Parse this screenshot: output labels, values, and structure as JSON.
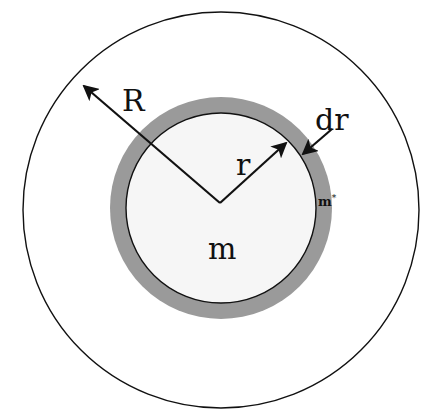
{
  "diagram": {
    "outer_circle": {
      "cx": 221,
      "cy": 210,
      "r": 198,
      "stroke": "#111111"
    },
    "shell_ring": {
      "cx": 221,
      "cy": 208,
      "r_outer": 111,
      "fill": "#9a9a9a"
    },
    "inner_sphere": {
      "cx": 221,
      "cy": 208,
      "r": 95,
      "fill": "#f6f6f6",
      "stroke": "#111111"
    },
    "arrows": {
      "R": {
        "x1": 220,
        "y1": 203,
        "x2": 82,
        "y2": 84
      },
      "r": {
        "x1": 220,
        "y1": 203,
        "x2": 287,
        "y2": 142
      },
      "dr": {
        "x1": 332,
        "y1": 129,
        "x2": 302,
        "y2": 155
      }
    },
    "labels": {
      "R": "R",
      "r": "r",
      "dr": "dr",
      "m": "m",
      "m_star_base": "m",
      "m_star_sup": "*"
    }
  }
}
